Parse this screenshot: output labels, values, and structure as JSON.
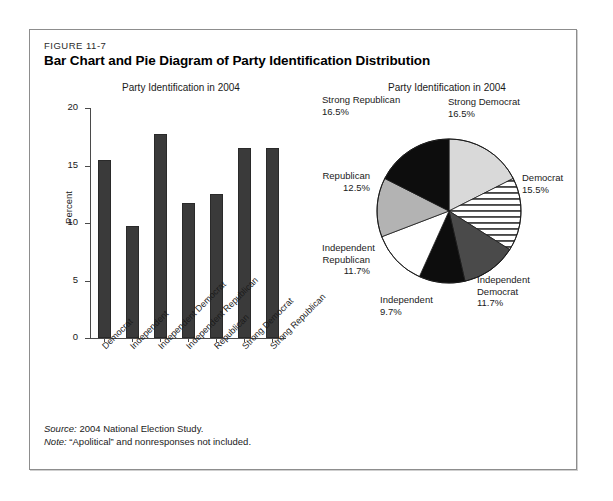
{
  "figure": {
    "number": "FIGURE 11-7",
    "title": "Bar Chart and Pie Diagram of Party Identification Distribution",
    "source_lead": "Source:",
    "source_text": " 2004 National Election Study.",
    "note_lead": "Note:",
    "note_text": " “Apolitical” and nonresponses not included."
  },
  "chart_data": [
    {
      "type": "bar",
      "title": "Party Identification in 2004",
      "xlabel": "",
      "ylabel": "Percent",
      "ylim": [
        0,
        20
      ],
      "yticks": [
        0,
        5,
        10,
        15,
        20
      ],
      "ytick_labels": [
        "0",
        "5",
        "10",
        "15",
        "20"
      ],
      "grid": false,
      "categories": [
        "Democrat",
        "Independent",
        "Independent Democrat",
        "Independent Republican",
        "Republican",
        "Strong Democrat",
        "Strong Republican"
      ],
      "values": [
        15.5,
        9.7,
        17.7,
        11.7,
        12.5,
        16.5,
        16.5
      ],
      "bar_color": "#3a3a3a"
    },
    {
      "type": "pie",
      "title": "Party Identification in 2004",
      "legend": "labels-outside",
      "labels": [
        "Strong Democrat",
        "Democrat",
        "Independent Democrat",
        "Independent",
        "Independent Republican",
        "Republican",
        "Strong Republican"
      ],
      "values": [
        16.5,
        15.5,
        11.7,
        9.7,
        11.7,
        12.5,
        16.5
      ],
      "value_labels": [
        "16.5%",
        "15.5%",
        "11.7%",
        "9.7%",
        "11.7%",
        "12.5%",
        "16.5%"
      ],
      "fills": [
        "#d9d9d9",
        "horizontal-stripes",
        "#4a4a4a",
        "#0d0d0d",
        "#ffffff",
        "#b3b3b3",
        "#0d0d0d"
      ]
    }
  ]
}
